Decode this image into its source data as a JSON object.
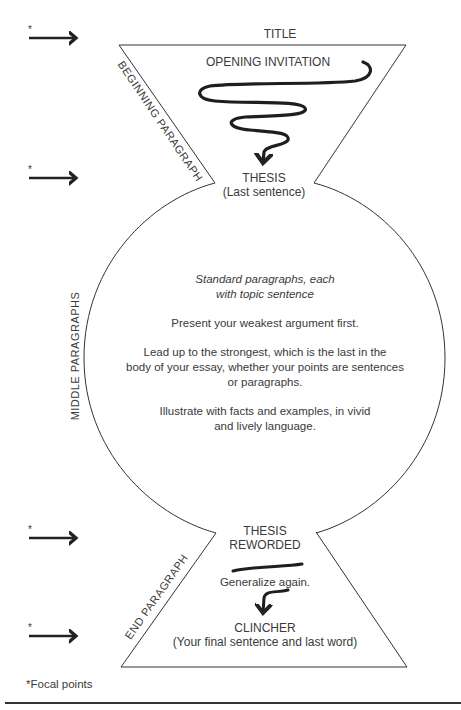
{
  "diagram": {
    "title": "TITLE",
    "sections": {
      "beginning": {
        "side_label": "BEGINNING PARAGRAPH",
        "opening": "OPENING INVITATION",
        "thesis": "THESIS",
        "thesis_note": "(Last sentence)"
      },
      "middle": {
        "side_label": "MIDDLE PARAGRAPHS",
        "intro_line1": "Standard paragraphs, each",
        "intro_line2": "with topic sentence",
        "point1": "Present your weakest argument first.",
        "point2_line1": "Lead up to the strongest, which is the last in the",
        "point2_line2": "body of your essay, whether your points are sentences",
        "point2_line3": "or paragraphs.",
        "point3_line1": "Illustrate with facts and examples, in vivid",
        "point3_line2": "and lively language."
      },
      "end": {
        "side_label": "END PARAGRAPH",
        "thesis_line1": "THESIS",
        "thesis_line2": "REWORDED",
        "generalize": "Generalize again.",
        "clincher": "CLINCHER",
        "clincher_note": "(Your final sentence and last word)"
      }
    },
    "focal_markers": [
      {
        "symbol": "*",
        "y": 38
      },
      {
        "symbol": "*",
        "y": 178
      },
      {
        "symbol": "*",
        "y": 538
      },
      {
        "symbol": "*",
        "y": 636
      }
    ],
    "footnote": "*Focal points",
    "colors": {
      "stroke": "#333333",
      "text": "#3a3a3a",
      "background": "#ffffff"
    }
  }
}
